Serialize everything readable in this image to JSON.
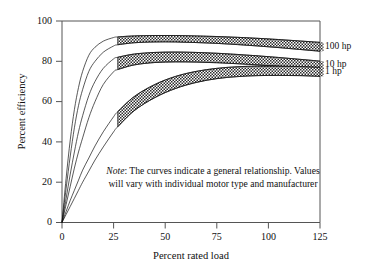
{
  "chart_data": {
    "type": "area",
    "title": "",
    "xlabel": "Percent rated load",
    "ylabel": "Percent efficiency",
    "xlim": [
      0,
      125
    ],
    "ylim": [
      0,
      100
    ],
    "xticks": [
      "0",
      "25",
      "50",
      "75",
      "100",
      "125"
    ],
    "xtick_values": [
      0,
      25,
      50,
      75,
      100,
      125
    ],
    "yticks": [
      "0",
      "20",
      "40",
      "60",
      "80",
      "100"
    ],
    "ytick_values": [
      0,
      20,
      40,
      60,
      80,
      100
    ],
    "grid": false,
    "legend_position": "right-outside",
    "band_fill": "#ffffff",
    "band_pattern": "checkerboard",
    "line_color": "#111111",
    "series": [
      {
        "name": "100 hp",
        "label": "100 hp",
        "band_start_x": 27,
        "upper": {
          "x": [
            0,
            2,
            4,
            6,
            8,
            10,
            13,
            16,
            20,
            25,
            27,
            35,
            45,
            55,
            65,
            75,
            85,
            95,
            105,
            115,
            125
          ],
          "y": [
            0,
            22,
            41,
            56,
            67,
            75,
            83,
            87,
            90,
            91.8,
            92.1,
            92.6,
            92.8,
            92.8,
            92.6,
            92.3,
            91.9,
            91.4,
            90.8,
            90.1,
            89.4
          ]
        },
        "lower": {
          "x": [
            0,
            2,
            4,
            6,
            8,
            10,
            13,
            16,
            20,
            25,
            27,
            35,
            45,
            55,
            65,
            75,
            85,
            95,
            105,
            115,
            125
          ],
          "y": [
            0,
            17,
            33,
            47,
            58,
            66,
            75,
            80,
            84.5,
            87.6,
            88.2,
            89.2,
            89.6,
            89.6,
            89.3,
            88.9,
            88.3,
            87.6,
            86.8,
            85.9,
            85.0
          ]
        }
      },
      {
        "name": "10 hp",
        "label": "10 hp",
        "band_start_x": 27,
        "upper": {
          "x": [
            0,
            2,
            4,
            6,
            8,
            10,
            13,
            16,
            20,
            25,
            27,
            35,
            45,
            55,
            65,
            75,
            85,
            95,
            105,
            115,
            125
          ],
          "y": [
            0,
            12,
            24,
            35,
            45,
            53,
            63,
            70,
            76.5,
            81.2,
            82.0,
            83.6,
            84.4,
            84.6,
            84.4,
            84.0,
            83.4,
            82.7,
            81.9,
            81.0,
            80.1
          ]
        },
        "lower": {
          "x": [
            0,
            2,
            4,
            6,
            8,
            10,
            13,
            16,
            20,
            25,
            27,
            35,
            45,
            55,
            65,
            75,
            85,
            95,
            105,
            115,
            125
          ],
          "y": [
            0,
            9,
            18,
            27,
            35,
            42,
            52,
            60,
            68.5,
            74.8,
            75.9,
            78.2,
            79.4,
            79.7,
            79.6,
            79.3,
            78.8,
            78.2,
            77.5,
            76.7,
            75.8
          ]
        }
      },
      {
        "name": "1 hp",
        "label": "1 hp",
        "band_start_x": 27,
        "upper": {
          "x": [
            0,
            2,
            4,
            6,
            8,
            10,
            13,
            16,
            20,
            25,
            27,
            35,
            45,
            55,
            65,
            75,
            85,
            95,
            105,
            115,
            125
          ],
          "y": [
            0,
            5.5,
            11,
            16,
            21,
            26,
            32,
            38,
            45,
            52.5,
            55.0,
            62.5,
            68.5,
            72.5,
            75.0,
            76.5,
            77.3,
            77.6,
            77.6,
            77.4,
            77.0
          ]
        },
        "lower": {
          "x": [
            0,
            2,
            4,
            6,
            8,
            10,
            13,
            16,
            20,
            25,
            27,
            35,
            45,
            55,
            65,
            75,
            85,
            95,
            105,
            115,
            125
          ],
          "y": [
            0,
            4,
            8,
            12,
            16,
            20,
            25.5,
            31,
            37.5,
            45.0,
            47.5,
            55.5,
            62.0,
            66.5,
            69.5,
            71.4,
            72.4,
            72.9,
            73.0,
            72.9,
            72.5
          ]
        }
      }
    ],
    "annotations": [
      {
        "name": "note",
        "emphasis": "Note",
        "text": ": The curves indicate a general relationship. Values will vary with individual motor type and manufacturer"
      }
    ]
  },
  "note": {
    "em": "Note",
    "line1": ": The curves indicate a general",
    "line2": "relationship. Values will vary with",
    "line3": "individual motor type and manufacturer"
  },
  "legend": {
    "items": [
      {
        "label": "100 hp"
      },
      {
        "label": "10 hp"
      },
      {
        "label": "1 hp"
      }
    ]
  },
  "axes": {
    "x_title": "Percent rated load",
    "y_title": "Percent efficiency"
  }
}
